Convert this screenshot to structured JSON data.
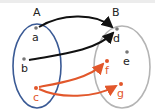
{
  "diagram": {
    "type": "set-mapping",
    "colors": {
      "set_a_outline": "#3a5a95",
      "set_b_outline": "#b4b4b4",
      "black_arrow": "#111111",
      "red_arrow": "#e2572b",
      "black_point": "#777777",
      "red_point": "#e2572b"
    },
    "sets": [
      {
        "name": "A",
        "label": "A",
        "elements": [
          "a",
          "b",
          "c"
        ]
      },
      {
        "name": "B",
        "label": "B",
        "elements": [
          "d",
          "e",
          "f",
          "g"
        ]
      }
    ],
    "points": {
      "a": {
        "label": "a",
        "color": "black"
      },
      "b": {
        "label": "b",
        "color": "black"
      },
      "c": {
        "label": "c",
        "color": "red"
      },
      "d": {
        "label": "d",
        "color": "black"
      },
      "e": {
        "label": "e",
        "color": "black"
      },
      "f": {
        "label": "f",
        "color": "red"
      },
      "g": {
        "label": "g",
        "color": "red"
      }
    },
    "arrows": [
      {
        "from": "a",
        "to": "d",
        "color": "black"
      },
      {
        "from": "b",
        "to": "d",
        "color": "black"
      },
      {
        "from": "c",
        "to": "f",
        "color": "red"
      },
      {
        "from": "c",
        "to": "g",
        "color": "red"
      }
    ]
  }
}
